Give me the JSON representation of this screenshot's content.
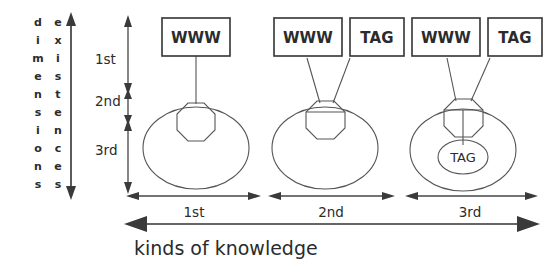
{
  "figure": {
    "caption": "kinds of knowledge",
    "vertical_axis": {
      "label_left": "dimensions",
      "label_right": "existences",
      "ticks": [
        "1st",
        "2nd",
        "3rd"
      ]
    },
    "horizontal_axis": {
      "segments": [
        "1st",
        "2nd",
        "3rd"
      ]
    },
    "columns": [
      {
        "id": "col-1",
        "boxes": [
          "WWW"
        ],
        "inner_node": null
      },
      {
        "id": "col-2",
        "boxes": [
          "WWW",
          "TAG"
        ],
        "inner_node": null
      },
      {
        "id": "col-3",
        "boxes": [
          "WWW",
          "TAG"
        ],
        "inner_node": "TAG"
      }
    ],
    "colors": {
      "background": "#ffffff",
      "line": "#555555",
      "box_border": "#333333",
      "text": "#2b2b2b"
    }
  }
}
